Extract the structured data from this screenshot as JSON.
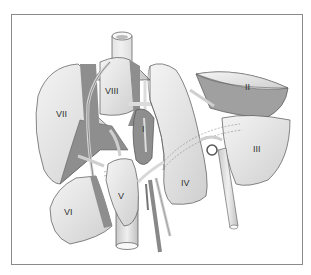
{
  "diagram": {
    "segments": [
      {
        "id": "I",
        "label": "I"
      },
      {
        "id": "II",
        "label": "II"
      },
      {
        "id": "III",
        "label": "III"
      },
      {
        "id": "IV",
        "label": "IV"
      },
      {
        "id": "V",
        "label": "V"
      },
      {
        "id": "VI",
        "label": "VI"
      },
      {
        "id": "VII",
        "label": "VII"
      },
      {
        "id": "VIII",
        "label": "VIII"
      }
    ],
    "colors": {
      "lobe": "#e6e6e6",
      "lobe_dark": "#8e8e8e",
      "vessel": "#dcdcdc",
      "outline": "#555555",
      "frame": "#8a8a8a"
    }
  }
}
